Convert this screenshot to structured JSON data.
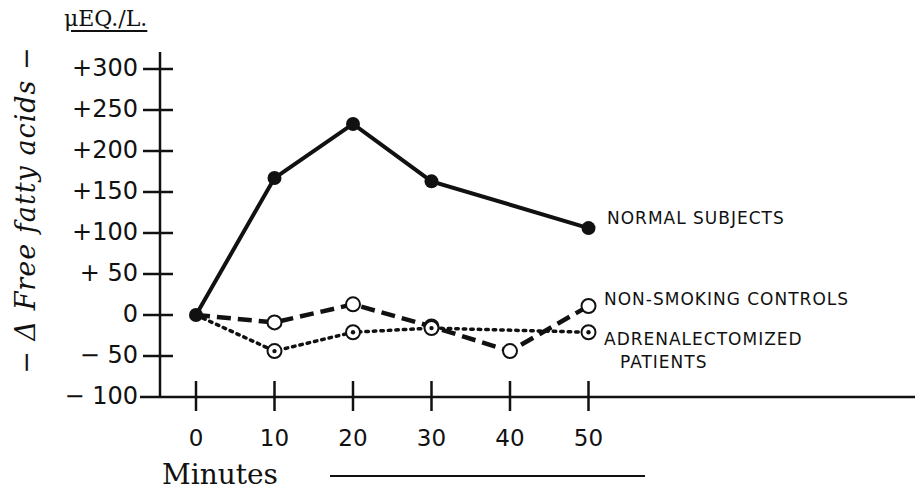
{
  "chart_data": {
    "type": "line",
    "title": "",
    "xlabel": "Minutes",
    "ylabel": "Δ Free fatty acids",
    "yunit": "μEq./L.",
    "x": [
      0,
      10,
      20,
      30,
      40,
      50
    ],
    "xtick_labels": [
      "0",
      "10",
      "20",
      "30",
      "40",
      "50"
    ],
    "ytick_labels": [
      "+300",
      "+250",
      "+200",
      "+150",
      "+100",
      "+ 50",
      "0",
      "− 50",
      "− 100"
    ],
    "ylim": [
      -100,
      300
    ],
    "grid": false,
    "legend_position": "inline-right",
    "series": [
      {
        "name": "NORMAL SUBJECTS",
        "style": "solid",
        "marker": "filled-circle",
        "x": [
          0,
          10,
          20,
          30,
          50
        ],
        "values": [
          0,
          167,
          233,
          163,
          106
        ]
      },
      {
        "name": "NON-SMOKING CONTROLS",
        "style": "dashed",
        "marker": "open-circle",
        "x": [
          0,
          10,
          20,
          30,
          40,
          50
        ],
        "values": [
          0,
          -9,
          13,
          -14,
          -44,
          11
        ]
      },
      {
        "name": "ADRENALECTOMIZED PATIENTS",
        "style": "dotted",
        "marker": "dotted-circle",
        "x": [
          0,
          10,
          20,
          30,
          50
        ],
        "values": [
          0,
          -44,
          -21,
          -16,
          -21
        ]
      }
    ]
  },
  "labels": {
    "ylabel": "− Δ Free fatty acids −",
    "unit": "μEQ./L.",
    "xlabel": "Minutes",
    "legend_normal": "NORMAL SUBJECTS",
    "legend_controls": "NON-SMOKING CONTROLS",
    "legend_adrenal_1": "ADRENALECTOMIZED",
    "legend_adrenal_2": "PATIENTS"
  }
}
